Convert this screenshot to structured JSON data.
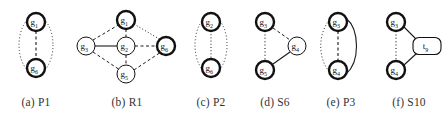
{
  "figure": {
    "type": "graph-pattern-panel",
    "panel_count": 6,
    "background_color": "#ffffff",
    "node_fill": "#ffffff",
    "node_stroke": "#111111",
    "edge_color": "#1a1a1a"
  },
  "subfigures": [
    {
      "id": "p1",
      "caption": "(a) P1",
      "label_prefix": "(a)",
      "label_name": "P1",
      "nodes": [
        {
          "id": "a-g1",
          "label": "g",
          "sub": "1",
          "bold": true,
          "x": 36,
          "y": 22,
          "r": 9
        },
        {
          "id": "a-g6",
          "label": "g",
          "sub": "6",
          "bold": true,
          "x": 36,
          "y": 68,
          "r": 9
        }
      ],
      "edges": [
        {
          "from": "a-g1",
          "to": "a-g6",
          "style": "dashed",
          "shape": "line"
        },
        {
          "from": "a-g1",
          "to": "a-g6",
          "style": "dotted",
          "shape": "arc-left"
        },
        {
          "from": "a-g1",
          "to": "a-g6",
          "style": "dotted",
          "shape": "arc-right"
        }
      ]
    },
    {
      "id": "r1",
      "caption": "(b) R1",
      "label_prefix": "(b)",
      "label_name": "R1",
      "nodes": [
        {
          "id": "b-g1",
          "label": "g",
          "sub": "1",
          "bold": true,
          "x": 126,
          "y": 20,
          "r": 9
        },
        {
          "id": "b-g3",
          "label": "g",
          "sub": "3",
          "bold": false,
          "x": 86,
          "y": 46,
          "r": 9
        },
        {
          "id": "b-g2",
          "label": "g",
          "sub": "2",
          "bold": false,
          "x": 126,
          "y": 46,
          "r": 9
        },
        {
          "id": "b-g6",
          "label": "g",
          "sub": "6",
          "bold": true,
          "x": 166,
          "y": 46,
          "r": 9
        },
        {
          "id": "b-g5",
          "label": "g",
          "sub": "5",
          "bold": false,
          "x": 126,
          "y": 74,
          "r": 9
        }
      ],
      "edges": [
        {
          "from": "b-g3",
          "to": "b-g1",
          "style": "dashed",
          "shape": "line"
        },
        {
          "from": "b-g1",
          "to": "b-g6",
          "style": "dotted",
          "shape": "line"
        },
        {
          "from": "b-g3",
          "to": "b-g5",
          "style": "dashed",
          "shape": "line"
        },
        {
          "from": "b-g5",
          "to": "b-g6",
          "style": "dashed",
          "shape": "line"
        },
        {
          "from": "b-g3",
          "to": "b-g2",
          "style": "solid",
          "shape": "line"
        },
        {
          "from": "b-g2",
          "to": "b-g6",
          "style": "dashed",
          "shape": "line"
        },
        {
          "from": "b-g1",
          "to": "b-g2",
          "style": "dashed",
          "shape": "line"
        },
        {
          "from": "b-g2",
          "to": "b-g5",
          "style": "dashed",
          "shape": "line"
        }
      ]
    },
    {
      "id": "p2",
      "caption": "(c) P2",
      "label_prefix": "(c)",
      "label_name": "P2",
      "nodes": [
        {
          "id": "c-g2",
          "label": "g",
          "sub": "2",
          "bold": true,
          "x": 210,
          "y": 22,
          "r": 9
        },
        {
          "id": "c-g6",
          "label": "g",
          "sub": "6",
          "bold": true,
          "x": 210,
          "y": 68,
          "r": 9
        }
      ],
      "edges": [
        {
          "from": "c-g2",
          "to": "c-g6",
          "style": "dotted",
          "shape": "line"
        },
        {
          "from": "c-g2",
          "to": "c-g6",
          "style": "dotted",
          "shape": "arc-left"
        },
        {
          "from": "c-g2",
          "to": "c-g6",
          "style": "dotted",
          "shape": "arc-right"
        }
      ]
    },
    {
      "id": "s6",
      "caption": "(d) S6",
      "label_prefix": "(d)",
      "label_name": "S6",
      "nodes": [
        {
          "id": "d-g3",
          "label": "g",
          "sub": "3",
          "bold": true,
          "x": 265,
          "y": 22,
          "r": 9
        },
        {
          "id": "d-g4",
          "label": "g",
          "sub": "4",
          "bold": false,
          "x": 297,
          "y": 46,
          "r": 9
        },
        {
          "id": "d-g5",
          "label": "g",
          "sub": "5",
          "bold": true,
          "x": 265,
          "y": 70,
          "r": 9
        }
      ],
      "edges": [
        {
          "from": "d-g3",
          "to": "d-g5",
          "style": "dotted",
          "shape": "line"
        },
        {
          "from": "d-g3",
          "to": "d-g4",
          "style": "dashed",
          "shape": "line"
        },
        {
          "from": "d-g5",
          "to": "d-g4",
          "style": "solid",
          "shape": "line"
        }
      ]
    },
    {
      "id": "p3",
      "caption": "(e) P3",
      "label_prefix": "(e)",
      "label_name": "P3",
      "nodes": [
        {
          "id": "e-g3",
          "label": "g",
          "sub": "3",
          "bold": true,
          "x": 338,
          "y": 22,
          "r": 9
        },
        {
          "id": "e-g4",
          "label": "g",
          "sub": "4",
          "bold": true,
          "x": 338,
          "y": 70,
          "r": 9
        }
      ],
      "edges": [
        {
          "from": "e-g3",
          "to": "e-g4",
          "style": "dashed",
          "shape": "line"
        },
        {
          "from": "e-g3",
          "to": "e-g4",
          "style": "dotted",
          "shape": "arc-left"
        },
        {
          "from": "e-g3",
          "to": "e-g4",
          "style": "solid",
          "shape": "arc-right"
        }
      ]
    },
    {
      "id": "s10",
      "caption": "(f) S10",
      "label_prefix": "(f)",
      "label_name": "S10",
      "nodes": [
        {
          "id": "f-g3",
          "label": "g",
          "sub": "3",
          "bold": true,
          "x": 396,
          "y": 22,
          "r": 9
        },
        {
          "id": "f-g4",
          "label": "g",
          "sub": "4",
          "bold": true,
          "x": 396,
          "y": 70,
          "r": 9
        }
      ],
      "box_node": {
        "id": "f-t9",
        "label": "t",
        "sub": "9",
        "x": 427,
        "y": 46,
        "w": 28,
        "h": 17
      },
      "edges": [
        {
          "from": "f-g3",
          "to": "f-g4",
          "style": "dotted",
          "shape": "line"
        },
        {
          "from": "f-g3",
          "to": "f-t9",
          "style": "solid",
          "shape": "line"
        },
        {
          "from": "f-g4",
          "to": "f-t9",
          "style": "solid",
          "shape": "line"
        }
      ]
    }
  ]
}
